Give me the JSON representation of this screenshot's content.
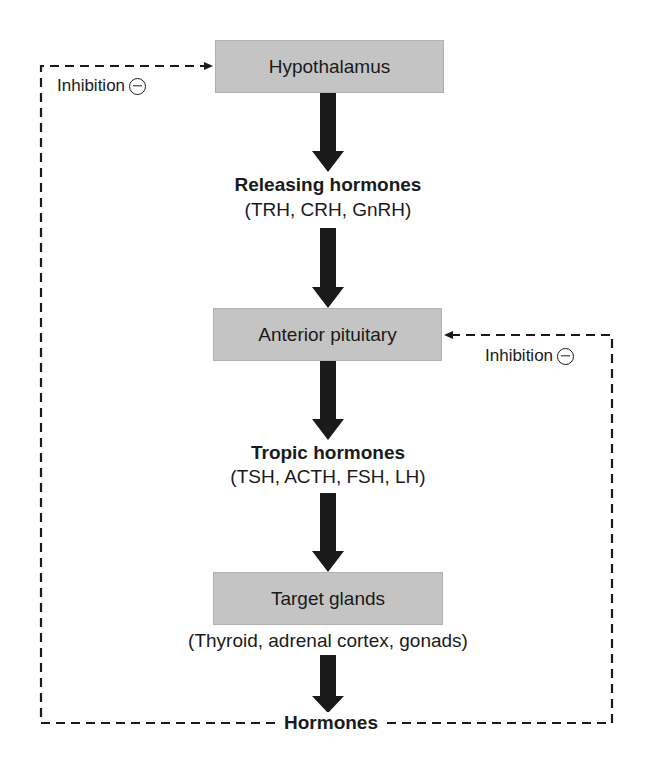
{
  "diagram": {
    "nodes": [
      {
        "id": "hypothalamus",
        "label": "Hypothalamus"
      },
      {
        "id": "anterior_pituitary",
        "label": "Anterior pituitary"
      },
      {
        "id": "target_glands",
        "label": "Target glands"
      }
    ],
    "intermediates": {
      "releasing": {
        "title": "Releasing hormones",
        "examples": "(TRH, CRH, GnRH)"
      },
      "tropic": {
        "title": "Tropic hormones",
        "examples": "(TSH, ACTH, FSH, LH)"
      },
      "target_examples": "(Thyroid, adrenal cortex, gonads)",
      "output": "Hormones"
    },
    "feedback": {
      "left_label": "Inhibition",
      "right_label": "Inhibition",
      "symbol": "minus-in-circle"
    },
    "colors": {
      "box_fill": "#c4c4c4",
      "arrow": "#1a1a1a",
      "dashed_line": "#1a1a1a"
    }
  }
}
